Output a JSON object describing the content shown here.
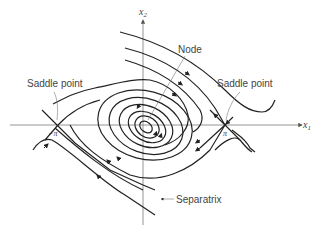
{
  "diagram": {
    "type": "phase-portrait",
    "axes": {
      "x_label": "x",
      "x_sub": "1",
      "y_label": "x",
      "y_sub": "2"
    },
    "tick_labels": {
      "neg_pi": "−π",
      "pos_pi": "π"
    },
    "annotations": {
      "node": "Node",
      "saddle_left": "Saddle point",
      "saddle_right": "Saddle point",
      "separatrix": "Separatrix"
    },
    "colors": {
      "trajectory": "#222222",
      "axis": "#888888",
      "label": "#444444"
    }
  }
}
